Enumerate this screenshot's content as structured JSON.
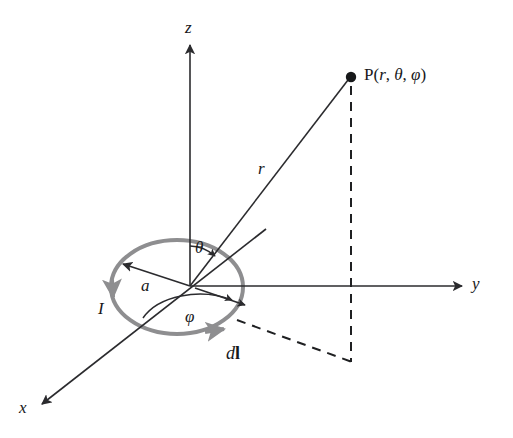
{
  "figure": {
    "type": "vector-diagram",
    "width": 513,
    "height": 438,
    "background": "#ffffff"
  },
  "colors": {
    "line": "#2b2b2e",
    "loop": "#8e8e90",
    "dashed": "#1f2022",
    "text": "#17181a",
    "background": "#ffffff"
  },
  "labels": {
    "axis_z": "z",
    "axis_y": "y",
    "axis_x": "x",
    "point_P_prefix": "P(",
    "point_P_r": "r",
    "point_P_sep1": ", ",
    "point_P_theta": "θ",
    "point_P_sep2": ", ",
    "point_P_phi": "φ",
    "point_P_suffix": ")",
    "point_P_full": "P(r, θ, φ)",
    "radius_r": "r",
    "loop_radius_a": "a",
    "current_I": "I",
    "angle_theta": "θ",
    "angle_phi": "φ",
    "element_d": "d",
    "element_l": "l",
    "element_dl_full": "dl"
  },
  "geometry": {
    "origin": {
      "x": 190,
      "y": 286
    },
    "z_axis": {
      "from_x": 190,
      "from_y": 286,
      "to_x": 190,
      "to_y": 45,
      "arrow": "up"
    },
    "y_axis": {
      "from_x": 190,
      "from_y": 286,
      "to_x": 462,
      "to_y": 286,
      "arrow": "right"
    },
    "x_axis": {
      "from_x": 266,
      "from_y": 229,
      "to_x": 42,
      "to_y": 404,
      "arrow": "to_lower_left"
    },
    "loop": {
      "cx": 177,
      "cy": 287,
      "rx": 66,
      "ry": 47,
      "stroke_width": 4
    },
    "radius_arrow": {
      "from_x": 190,
      "from_y": 286,
      "to_x": 123,
      "to_y": 264
    },
    "point_P": {
      "x": 351,
      "y": 77,
      "dot_radius": 5
    },
    "r_line": {
      "from_x": 190,
      "from_y": 286,
      "to_x": 351,
      "to_y": 77
    },
    "dashed_vertical": {
      "x": 351,
      "from_y": 84,
      "to_y": 362
    },
    "dashed_diagonal": {
      "from_x": 237,
      "from_y": 320,
      "to_x": 351,
      "to_y": 362
    },
    "dl_arrow": {
      "from_x": 196,
      "from_y": 288,
      "to_x": 249,
      "to_y": 306
    },
    "theta_arc": {
      "radius": 40,
      "from_deg": 90,
      "to_deg": 52
    },
    "phi_arc": {
      "rx": 56,
      "ry": 34
    }
  },
  "label_positions": {
    "axis_z": {
      "x": 185,
      "y": 19
    },
    "axis_y": {
      "x": 472,
      "y": 276
    },
    "axis_x": {
      "x": 19,
      "y": 400
    },
    "point_P": {
      "x": 364,
      "y": 66
    },
    "radius_r": {
      "x": 258,
      "y": 160
    },
    "loop_radius_a": {
      "x": 141,
      "y": 278
    },
    "current_I": {
      "x": 98,
      "y": 300
    },
    "angle_theta": {
      "x": 195,
      "y": 240
    },
    "angle_phi": {
      "x": 185,
      "y": 309
    },
    "element_dl": {
      "x": 226,
      "y": 345
    }
  }
}
